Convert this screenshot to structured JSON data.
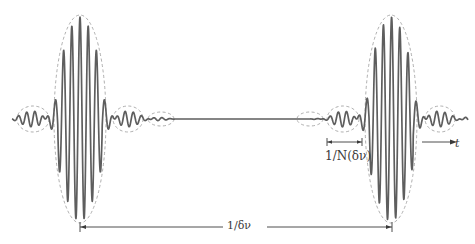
{
  "figure": {
    "title": "",
    "colors": {
      "waveform": "#5e5e5e",
      "envelope": "#9a9a9a",
      "annotation": "#3a3a3a",
      "background": "#ffffff"
    },
    "labels": {
      "period": "1/δν",
      "pulse_width": "1/N(δν)",
      "time_axis": "t"
    },
    "main_pulses": [
      {
        "name": "left-main-pulse",
        "center_x": 80
      },
      {
        "name": "right-main-pulse",
        "center_x": 391
      }
    ],
    "annotations": [
      {
        "name": "period-bracket",
        "from_x": 80,
        "to_x": 392,
        "y": 227,
        "label": "1/δν"
      },
      {
        "name": "pulse-width-bracket",
        "from_x": 327,
        "to_x": 362,
        "y": 142,
        "label": "1/N(δν)"
      },
      {
        "name": "time-arrow",
        "from_x": 422,
        "to_x": 456,
        "y": 142,
        "label": "t"
      }
    ]
  }
}
